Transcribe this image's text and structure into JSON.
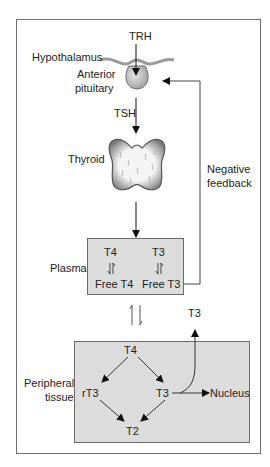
{
  "diagram": {
    "labels": {
      "trh": "TRH",
      "hypothalamus": "Hypothalamus",
      "anterior": "Anterior",
      "pituitary": "pituitary",
      "tsh": "TSH",
      "thyroid": "Thyroid",
      "negative": "Negative",
      "feedback": "feedback",
      "plasma": "Plasma",
      "peripheral": "Peripheral",
      "tissue": "tissue",
      "t3_out": "T3"
    },
    "plasma_box": {
      "t4": "T4",
      "t3": "T3",
      "free_t4": "Free T4",
      "free_t3": "Free T3"
    },
    "peripheral_box": {
      "t4": "T4",
      "rt3": "rT3",
      "t3": "T3",
      "t2": "T2",
      "nucleus": "Nucleus"
    },
    "colors": {
      "box_fill": "#dcdcdc",
      "line": "#222222",
      "frame": "#6e6e6e"
    }
  }
}
